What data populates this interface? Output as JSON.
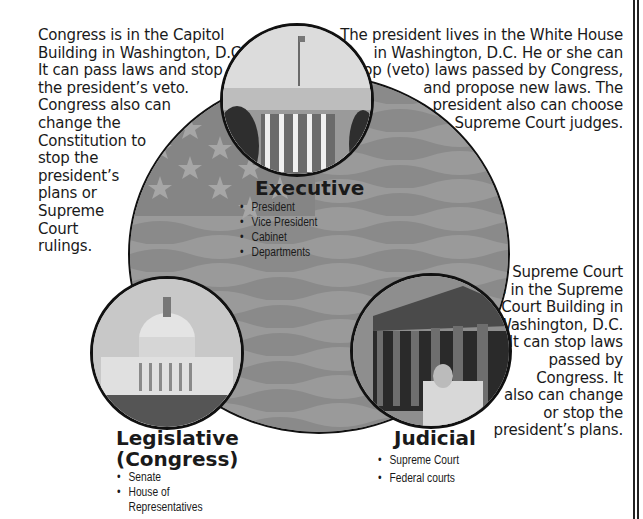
{
  "executive": {
    "description_lines": [
      "The president lives in the White House",
      "in Washington, D.C.  He or she can",
      "stop (veto) laws passed by Congress,",
      "and propose new laws.  The",
      "president also can choose",
      "Supreme Court judges."
    ],
    "title": "Executive",
    "items": [
      "President",
      "Vice President",
      "Cabinet",
      "Departments"
    ],
    "photo": "white-house-photo"
  },
  "legislative": {
    "description_lines": [
      "Congress is in the Capitol",
      "Building in Washington, D.C.",
      "It can pass laws and stop",
      "the president’s veto.",
      "Congress also can",
      "change the",
      "Constitution to",
      "stop the",
      "president’s",
      "plans or",
      "Supreme",
      "Court",
      "rulings."
    ],
    "title_line1": "Legislative",
    "title_line2": "(Congress)",
    "items": [
      "Senate",
      "House of",
      "Representatives"
    ],
    "photo": "capitol-building-photo"
  },
  "judicial": {
    "description_lines": [
      "The Supreme Court",
      "is in the Supreme",
      "Court Building in",
      "Washington, D.C.",
      "It can stop laws",
      "passed by",
      "Congress.  It",
      "also can change",
      "or stop the",
      "president’s plans."
    ],
    "title": "Judicial",
    "items": [
      "Supreme Court",
      "Federal courts"
    ],
    "photo": "supreme-court-photo"
  },
  "colors": {
    "flag_stripe_dark": "#8e8e8e",
    "flag_stripe_light": "#a2a2a2",
    "outline": "#111111",
    "text": "#1a1a1a"
  }
}
